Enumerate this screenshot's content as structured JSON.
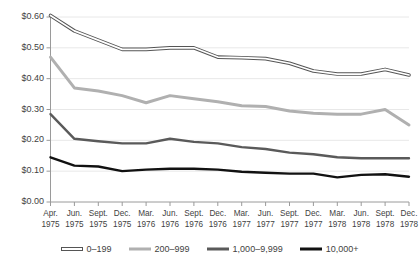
{
  "chart_data": {
    "type": "line",
    "title": "",
    "xlabel": "",
    "ylabel": "",
    "grid": true,
    "legend_position": "bottom",
    "ylim": [
      0.0,
      0.6
    ],
    "ytick_values": [
      0.0,
      0.1,
      0.2,
      0.3,
      0.4,
      0.5,
      0.6
    ],
    "ytick_labels": [
      "$0.00",
      "$0.10",
      "$0.20",
      "$0.30",
      "$0.40",
      "$0.50",
      "$0.60"
    ],
    "categories": [
      "Apr. 1975",
      "Jun. 1975",
      "Sept. 1975",
      "Dec. 1975",
      "Mar. 1976",
      "Jun. 1976",
      "Sept. 1976",
      "Dec. 1976",
      "Mar. 1977",
      "Jun. 1977",
      "Sept. 1977",
      "Dec. 1977",
      "Mar. 1978",
      "Jun. 1978",
      "Sept. 1978",
      "Dec. 1978"
    ],
    "xtick_months": [
      "Apr.",
      "Jun.",
      "Sept.",
      "Dec.",
      "Mar.",
      "Jun.",
      "Sept.",
      "Dec.",
      "Mar.",
      "Jun.",
      "Sept.",
      "Dec.",
      "Mar.",
      "Jun.",
      "Sept.",
      "Dec."
    ],
    "xtick_years": [
      "1975",
      "1975",
      "1975",
      "1975",
      "1976",
      "1976",
      "1976",
      "1976",
      "1977",
      "1977",
      "1977",
      "1977",
      "1978",
      "1978",
      "1978",
      "1978"
    ],
    "series": [
      {
        "name": "0-199",
        "color": "#ffffff",
        "outline_color": "#555555",
        "style": "outlined",
        "values": [
          0.605,
          0.555,
          0.525,
          0.495,
          0.495,
          0.5,
          0.5,
          0.47,
          0.468,
          0.465,
          0.45,
          0.425,
          0.415,
          0.415,
          0.43,
          0.412
        ]
      },
      {
        "name": "200-999",
        "color": "#b0b0b0",
        "style": "solid",
        "values": [
          0.47,
          0.37,
          0.36,
          0.345,
          0.322,
          0.345,
          0.335,
          0.325,
          0.312,
          0.31,
          0.295,
          0.288,
          0.285,
          0.285,
          0.3,
          0.25
        ]
      },
      {
        "name": "1,000-9,999",
        "color": "#5a5a5a",
        "style": "solid",
        "values": [
          0.285,
          0.205,
          0.197,
          0.19,
          0.19,
          0.205,
          0.195,
          0.19,
          0.178,
          0.172,
          0.16,
          0.155,
          0.145,
          0.142,
          0.142,
          0.142
        ]
      },
      {
        "name": "10,000+",
        "color": "#111111",
        "style": "solid",
        "values": [
          0.145,
          0.118,
          0.115,
          0.1,
          0.105,
          0.108,
          0.108,
          0.105,
          0.098,
          0.095,
          0.092,
          0.092,
          0.08,
          0.088,
          0.09,
          0.082
        ]
      }
    ]
  },
  "legend": {
    "items": [
      {
        "label": "0–199"
      },
      {
        "label": "200–999"
      },
      {
        "label": "1,000–9,999"
      },
      {
        "label": "10,000+"
      }
    ]
  }
}
